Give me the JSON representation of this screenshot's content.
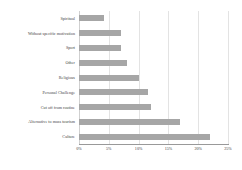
{
  "chart_data": {
    "type": "bar",
    "orientation": "horizontal",
    "title": "",
    "xlabel": "",
    "ylabel": "",
    "xlim": [
      0,
      25
    ],
    "grid": true,
    "legend": false,
    "bar_color": "#a6a6a6",
    "tick_labels": [
      "0%",
      "5%",
      "10%",
      "15%",
      "20%",
      "25%"
    ],
    "tick_values": [
      0,
      5,
      10,
      15,
      20,
      25
    ],
    "categories": [
      "Spiritual",
      "Without specific motivation",
      "Sport",
      "Other",
      "Religious",
      "Personal Challenge",
      "Cut off from routine",
      "Alternative to mass tourism",
      "Culture"
    ],
    "values": [
      4.2,
      7.0,
      7.0,
      8.0,
      10.0,
      11.5,
      12.0,
      17.0,
      22.0
    ]
  }
}
